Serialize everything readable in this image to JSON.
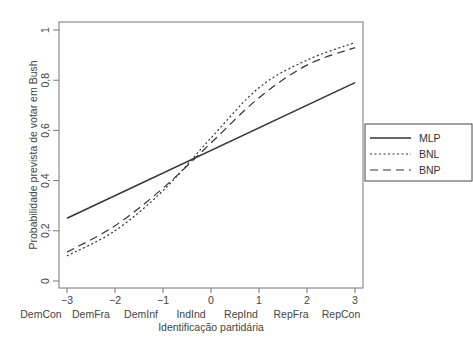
{
  "chart_data": {
    "type": "line",
    "title": "",
    "xlabel": "Identificação partidária",
    "ylabel": "Probabilidade prevista de votar em Bush",
    "x": [
      -3,
      -2,
      -1,
      0,
      1,
      2,
      3
    ],
    "x_tick_labels": [
      "−3",
      "−2",
      "−1",
      "0",
      "1",
      "2",
      "3"
    ],
    "x_category_labels": [
      "DemCon",
      "DemFra",
      "DemInf",
      "IndInd",
      "RepInd",
      "RepFra",
      "RepCon"
    ],
    "y_ticks": [
      0,
      0.2,
      0.4,
      0.6,
      0.8,
      1
    ],
    "y_tick_labels": [
      "0",
      "0,2",
      "0,4",
      "0,6",
      "0,8",
      "1"
    ],
    "xlim": [
      -3,
      3
    ],
    "ylim": [
      0,
      1
    ],
    "grid": false,
    "legend_position": "right-outside",
    "series": [
      {
        "name": "MLP",
        "style": "solid",
        "values": [
          0.25,
          0.34,
          0.43,
          0.52,
          0.61,
          0.7,
          0.79
        ]
      },
      {
        "name": "BNL",
        "style": "dotted",
        "values": [
          0.1,
          0.2,
          0.36,
          0.57,
          0.77,
          0.88,
          0.95
        ]
      },
      {
        "name": "BNP",
        "style": "dashed",
        "values": [
          0.115,
          0.22,
          0.37,
          0.55,
          0.73,
          0.86,
          0.93
        ]
      }
    ]
  }
}
